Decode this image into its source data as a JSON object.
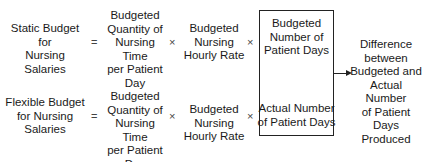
{
  "rows": [
    {
      "label": "Static Budget for\nNursing Salaries",
      "equals": "=",
      "quantity": "Budgeted\nQuantity of\nNursing Time\nper Patient\nDay",
      "times1": "×",
      "rate": "Budgeted\nNursing\nHourly Rate",
      "times2": "×",
      "days": "Budgeted\nNumber of\nPatient Days"
    },
    {
      "label": "Flexible Budget\nfor Nursing\nSalaries",
      "equals": "=",
      "quantity": "Budgeted\nQuantity of\nNursing Time\nper Patient\nDay",
      "times1": "×",
      "rate": "Budgeted\nNursing\nHourly Rate",
      "times2": "×",
      "days": "Actual Number\nof Patient Days"
    }
  ],
  "result": "Difference\nbetween\nBudgeted and\nActual Number\nof Patient\nDays\nProduced"
}
